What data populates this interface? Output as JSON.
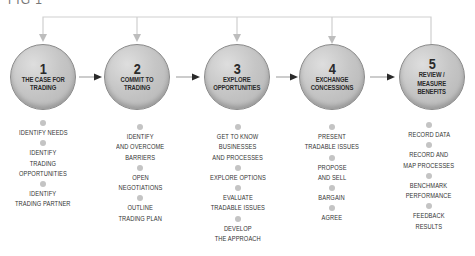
{
  "figure": {
    "label": "FIG 1"
  },
  "colors": {
    "circle_fill": "#c6c6c6",
    "circle_stroke": "#8a8a8a",
    "connector": "#c8c8c8",
    "arrow": "#333333",
    "text": "#333333",
    "dot": "#c4c4c4"
  },
  "stages": [
    {
      "number": "1",
      "title": "THE CASE FOR\nTRADING",
      "steps": [
        "IDENTIFY NEEDS",
        "IDENTIFY\nTRADING\nOPPORTUNITIES",
        "IDENTIFY\nTRADING PARTNER"
      ]
    },
    {
      "number": "2",
      "title": "COMMIT TO\nTRADING",
      "steps": [
        "IDENTIFY\nAND OVERCOME\nBARRIERS",
        "OPEN\nNEGOTIATIONS",
        "OUTLINE\nTRADING PLAN"
      ]
    },
    {
      "number": "3",
      "title": "EXPLORE\nOPPORTUNITIES",
      "steps": [
        "GET TO KNOW\nBUSINESSES\nAND PROCESSES",
        "EXPLORE OPTIONS",
        "EVALUATE\nTRADABLE ISSUES",
        "DEVELOP\nTHE APPROACH"
      ]
    },
    {
      "number": "4",
      "title": "EXCHANGE\nCONCESSIONS",
      "steps": [
        "PRESENT\nTRADABLE ISSUES",
        "PROPOSE\nAND SELL",
        "BARGAIN",
        "AGREE"
      ]
    },
    {
      "number": "5",
      "title": "REVIEW /\nMEASURE\nBENEFITS",
      "steps": [
        "RECORD DATA",
        "RECORD AND\nMAP PROCESSES",
        "BENCHMARK\nPERFORMANCE",
        "FEEDBACK\nRESULTS"
      ]
    }
  ]
}
